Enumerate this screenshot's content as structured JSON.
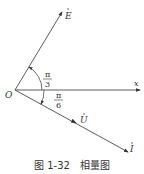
{
  "diagram": {
    "origin_label": "O",
    "x_axis_label": "x",
    "phasors": [
      {
        "label": "E",
        "dot": true,
        "angle": "π/3"
      },
      {
        "label": "U",
        "dot": true,
        "angle": "-π/6"
      },
      {
        "label": "I",
        "dot": true,
        "angle": "-π/6"
      }
    ],
    "angle_labels": {
      "upper": {
        "num": "π",
        "den": "3"
      },
      "lower": {
        "num": "π",
        "den": "6"
      }
    },
    "colors": {
      "line": "#333333"
    }
  },
  "caption": "图 1-32　相量图"
}
